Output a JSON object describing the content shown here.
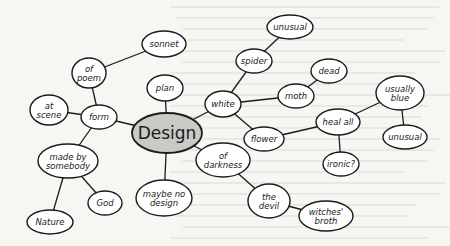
{
  "diagram": {
    "type": "mind-map",
    "colors": {
      "center_fill": "#c9c9c6",
      "node_fill": "#ffffff",
      "stroke": "#1b1b1b",
      "background": "#f7f6f3"
    },
    "nodes": [
      {
        "id": "design",
        "lines": [
          "Design"
        ],
        "x": 167,
        "y": 133,
        "rx": 35,
        "ry": 20,
        "center": true
      },
      {
        "id": "plan",
        "lines": [
          "plan"
        ],
        "x": 165,
        "y": 88,
        "rx": 18,
        "ry": 13
      },
      {
        "id": "form",
        "lines": [
          "form"
        ],
        "x": 99,
        "y": 117,
        "rx": 18,
        "ry": 12
      },
      {
        "id": "of-poem",
        "lines": [
          "of",
          "poem"
        ],
        "x": 89,
        "y": 73,
        "rx": 17,
        "ry": 15
      },
      {
        "id": "sonnet",
        "lines": [
          "sonnet"
        ],
        "x": 164,
        "y": 44,
        "rx": 22,
        "ry": 13
      },
      {
        "id": "at-scene",
        "lines": [
          "at",
          "scene"
        ],
        "x": 49,
        "y": 110,
        "rx": 19,
        "ry": 15
      },
      {
        "id": "made-by-somebody",
        "lines": [
          "made by",
          "somebody"
        ],
        "x": 68,
        "y": 161,
        "rx": 30,
        "ry": 17
      },
      {
        "id": "nature",
        "lines": [
          "Nature"
        ],
        "x": 50,
        "y": 222,
        "rx": 23,
        "ry": 12
      },
      {
        "id": "god",
        "lines": [
          "God"
        ],
        "x": 105,
        "y": 203,
        "rx": 17,
        "ry": 12
      },
      {
        "id": "maybe-no-design",
        "lines": [
          "maybe no",
          "design"
        ],
        "x": 164,
        "y": 198,
        "rx": 28,
        "ry": 18
      },
      {
        "id": "white",
        "lines": [
          "white"
        ],
        "x": 223,
        "y": 104,
        "rx": 18,
        "ry": 13
      },
      {
        "id": "spider",
        "lines": [
          "spider"
        ],
        "x": 254,
        "y": 61,
        "rx": 18,
        "ry": 12
      },
      {
        "id": "unusual-top",
        "lines": [
          "unusual"
        ],
        "x": 290,
        "y": 27,
        "rx": 23,
        "ry": 12
      },
      {
        "id": "moth",
        "lines": [
          "moth"
        ],
        "x": 296,
        "y": 96,
        "rx": 18,
        "ry": 12
      },
      {
        "id": "dead",
        "lines": [
          "dead"
        ],
        "x": 329,
        "y": 71,
        "rx": 18,
        "ry": 12
      },
      {
        "id": "flower",
        "lines": [
          "flower"
        ],
        "x": 264,
        "y": 139,
        "rx": 20,
        "ry": 12
      },
      {
        "id": "heal-all",
        "lines": [
          "heal all"
        ],
        "x": 338,
        "y": 122,
        "rx": 22,
        "ry": 13
      },
      {
        "id": "usually-blue",
        "lines": [
          "usually",
          "blue"
        ],
        "x": 400,
        "y": 93,
        "rx": 24,
        "ry": 17
      },
      {
        "id": "unusual-right",
        "lines": [
          "unusual"
        ],
        "x": 405,
        "y": 137,
        "rx": 22,
        "ry": 12
      },
      {
        "id": "ironic",
        "lines": [
          "ironic?"
        ],
        "x": 341,
        "y": 164,
        "rx": 18,
        "ry": 12
      },
      {
        "id": "of-darkness",
        "lines": [
          "of",
          "darkness"
        ],
        "x": 223,
        "y": 160,
        "rx": 27,
        "ry": 17
      },
      {
        "id": "the-devil",
        "lines": [
          "the",
          "devil"
        ],
        "x": 269,
        "y": 201,
        "rx": 21,
        "ry": 17
      },
      {
        "id": "witches-broth",
        "lines": [
          "witches'",
          "broth"
        ],
        "x": 326,
        "y": 216,
        "rx": 27,
        "ry": 15
      }
    ],
    "edges": [
      [
        "design",
        "plan"
      ],
      [
        "design",
        "form"
      ],
      [
        "design",
        "white"
      ],
      [
        "design",
        "of-darkness"
      ],
      [
        "design",
        "maybe-no-design"
      ],
      [
        "form",
        "of-poem"
      ],
      [
        "of-poem",
        "sonnet"
      ],
      [
        "form",
        "at-scene"
      ],
      [
        "form",
        "made-by-somebody"
      ],
      [
        "made-by-somebody",
        "nature"
      ],
      [
        "made-by-somebody",
        "god"
      ],
      [
        "white",
        "spider"
      ],
      [
        "spider",
        "unusual-top"
      ],
      [
        "white",
        "moth"
      ],
      [
        "moth",
        "dead"
      ],
      [
        "white",
        "flower"
      ],
      [
        "flower",
        "heal-all"
      ],
      [
        "heal-all",
        "usually-blue"
      ],
      [
        "usually-blue",
        "unusual-right"
      ],
      [
        "heal-all",
        "ironic"
      ],
      [
        "of-darkness",
        "the-devil"
      ],
      [
        "the-devil",
        "witches-broth"
      ]
    ]
  }
}
